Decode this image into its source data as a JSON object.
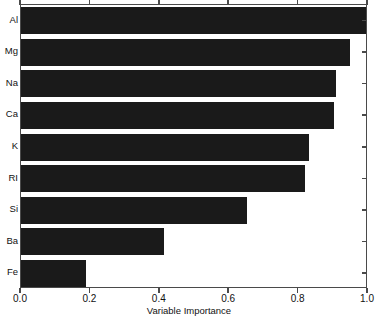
{
  "chart_data": {
    "type": "bar",
    "orientation": "horizontal",
    "title": "",
    "xlabel": "Variable Importance",
    "ylabel": "",
    "categories": [
      "Al",
      "Mg",
      "Na",
      "Ca",
      "K",
      "RI",
      "Si",
      "Ba",
      "Fe"
    ],
    "values": [
      1.0,
      0.945,
      0.905,
      0.9,
      0.827,
      0.815,
      0.648,
      0.409,
      0.185
    ],
    "xlim": [
      0.0,
      1.0
    ],
    "xticks": [
      0.0,
      0.2,
      0.4,
      0.6,
      0.8,
      1.0
    ],
    "xtick_labels": [
      "0.0",
      "0.2",
      "0.4",
      "0.6",
      "0.8",
      "1.0"
    ],
    "grid": false,
    "legend": null,
    "bar_color": "#1a1a1a",
    "frame_color": "#4a4a4a",
    "background": "#ffffff"
  }
}
